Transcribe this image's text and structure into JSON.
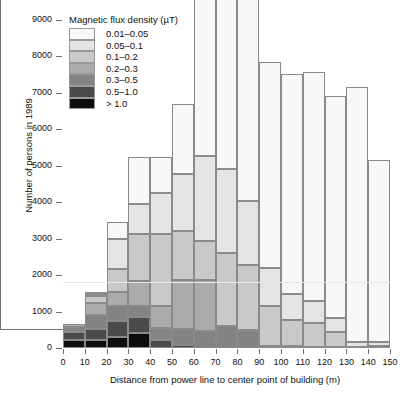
{
  "chart_data": {
    "type": "bar",
    "subtype": "stacked-histogram",
    "title": "",
    "xlabel": "Distance from power line to center point of building (m)",
    "ylabel": "Number of persons in 1989",
    "xlim": [
      0,
      150
    ],
    "ylim": [
      0,
      9000
    ],
    "xticks": [
      0,
      10,
      20,
      30,
      40,
      50,
      60,
      70,
      80,
      90,
      100,
      110,
      120,
      130,
      140,
      150
    ],
    "yticks": [
      0,
      1000,
      2000,
      3000,
      4000,
      5000,
      6000,
      7000,
      8000,
      9000
    ],
    "grid": false,
    "reference_line_y": 1800,
    "bin_width": 10,
    "legend": {
      "title": "Magnetic flux density (µT)",
      "position": "top-left",
      "entries": [
        {
          "label": "0.01–0.05",
          "color": "#f7f7f7"
        },
        {
          "label": "0.05–0.1",
          "color": "#e4e4e4"
        },
        {
          "label": "0.1–0.2",
          "color": "#c9c9c9"
        },
        {
          "label": "0.2–0.3",
          "color": "#ababab"
        },
        {
          "label": "0.3–0.5",
          "color": "#838383"
        },
        {
          "label": "0.5–1.0",
          "color": "#4a4a4a"
        },
        {
          "label": "> 1.0",
          "color": "#0d0d0d"
        }
      ]
    },
    "categories": [
      "0–10",
      "10–20",
      "20–30",
      "30–40",
      "40–50",
      "50–60",
      "60–70",
      "70–80",
      "80–90",
      "90–100",
      "100–110",
      "110–120",
      "120–130",
      "130–140",
      "140–150"
    ],
    "bin_starts": [
      0,
      10,
      20,
      30,
      40,
      50,
      60,
      70,
      80,
      90,
      100,
      110,
      120,
      130,
      140
    ],
    "series": [
      {
        "name": "0.01–0.05",
        "color": "#f7f7f7",
        "values": [
          0,
          20,
          450,
          1290,
          1000,
          1930,
          4400,
          4900,
          5560,
          5660,
          6020,
          6260,
          6100,
          6980,
          5000
        ]
      },
      {
        "name": "0.05–0.1",
        "color": "#e4e4e4",
        "values": [
          0,
          60,
          840,
          840,
          1110,
          1560,
          2320,
          2300,
          1770,
          1050,
          730,
          620,
          380,
          130,
          120
        ]
      },
      {
        "name": "0.1–0.2",
        "color": "#c9c9c9",
        "values": [
          0,
          190,
          620,
          1290,
          1990,
          1340,
          1070,
          1990,
          1770,
          1080,
          710,
          640,
          410,
          40,
          45
        ]
      },
      {
        "name": "0.2–0.3",
        "color": "#ababab",
        "values": [
          80,
          330,
          390,
          670,
          580,
          1340,
          1400,
          0,
          0,
          0,
          0,
          0,
          0,
          0,
          0
        ]
      },
      {
        "name": "0.3–0.5",
        "color": "#838383",
        "values": [
          130,
          380,
          420,
          300,
          340,
          450,
          480,
          610,
          500,
          60,
          50,
          40,
          30,
          0,
          0
        ]
      },
      {
        "name": "0.5–1.0",
        "color": "#4a4a4a",
        "values": [
          220,
          320,
          440,
          460,
          220,
          80,
          0,
          0,
          0,
          0,
          0,
          0,
          0,
          0,
          0
        ]
      },
      {
        "name": "> 1.0",
        "color": "#0d0d0d",
        "values": [
          230,
          210,
          290,
          400,
          0,
          0,
          0,
          0,
          0,
          0,
          0,
          0,
          0,
          0,
          0
        ]
      }
    ],
    "totals": [
      660,
      1510,
      3450,
      5250,
      5240,
      6700,
      9670,
      9800,
      9600,
      7850,
      7510,
      7560,
      6920,
      7150,
      5165
    ],
    "stack_tops": [
      660,
      1510,
      3450,
      5250,
      4240,
      6700,
      9670,
      9800,
      9600,
      7850,
      7510,
      7560,
      6920,
      7150,
      5165
    ]
  }
}
